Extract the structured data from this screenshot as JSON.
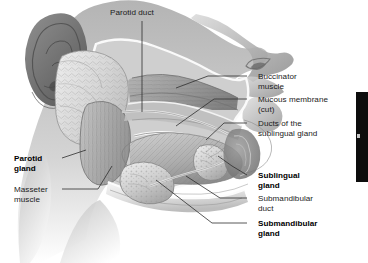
{
  "figure": {
    "background_color": "#ffffff",
    "width": 368,
    "height": 263,
    "style": "grayscale medical illustration"
  },
  "labels": [
    {
      "id": "parotid-duct",
      "text": "Parotid duct",
      "bold": false,
      "side": "top",
      "x": 110,
      "y": 8
    },
    {
      "id": "buccinator-muscle",
      "text": "Buccinator\nmuscle",
      "bold": false,
      "side": "right",
      "x": 258,
      "y": 72
    },
    {
      "id": "mucous-membrane-cut",
      "text": "Mucous membrane\n(cut)",
      "bold": false,
      "side": "right",
      "x": 258,
      "y": 95
    },
    {
      "id": "ducts-of-sublingual-gland",
      "text": "Ducts of the\nsublingual gland",
      "bold": false,
      "side": "right",
      "x": 258,
      "y": 119
    },
    {
      "id": "sublingual-gland",
      "text": "Sublingual\ngland",
      "bold": true,
      "side": "right",
      "x": 258,
      "y": 171
    },
    {
      "id": "submandibular-duct",
      "text": "Submandibular\nduct",
      "bold": false,
      "side": "right",
      "x": 258,
      "y": 194
    },
    {
      "id": "submandibular-gland",
      "text": "Submandibular\ngland",
      "bold": true,
      "side": "right",
      "x": 258,
      "y": 219
    },
    {
      "id": "parotid-gland",
      "text": "Parotid\ngland",
      "bold": true,
      "side": "left",
      "x": 14,
      "y": 154
    },
    {
      "id": "masseter-muscle",
      "text": "Masseter\nmuscle",
      "bold": false,
      "side": "left",
      "x": 14,
      "y": 185
    }
  ],
  "edge_bar": {
    "id": "right-edge-dark-bar",
    "color": "#0d0d0d",
    "x": 356,
    "y": 92,
    "width": 12,
    "height": 90
  }
}
